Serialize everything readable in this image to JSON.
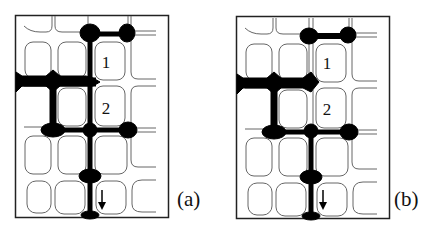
{
  "figure": {
    "panels": [
      {
        "id": "a",
        "label": "(a)",
        "cell_labels": [
          {
            "text": "1",
            "row": 1,
            "col": 2
          },
          {
            "text": "2",
            "row": 2,
            "col": 2
          }
        ],
        "arrow": {
          "direction": "down",
          "row": 4,
          "col": 2
        }
      },
      {
        "id": "b",
        "label": "(b)",
        "cell_labels": [
          {
            "text": "1",
            "row": 1,
            "col": 2
          },
          {
            "text": "2",
            "row": 2,
            "col": 2
          }
        ],
        "arrow": {
          "direction": "down",
          "row": 4,
          "col": 2
        }
      }
    ],
    "colors": {
      "ink": "#000000",
      "line": "#555555",
      "background": "#ffffff"
    }
  }
}
